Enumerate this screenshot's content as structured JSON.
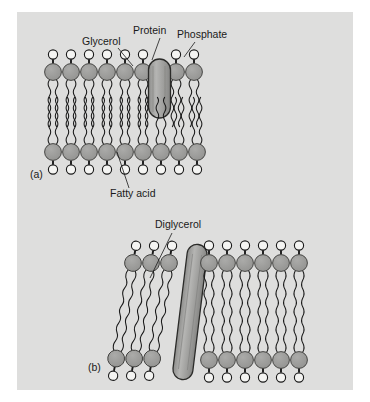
{
  "figure": {
    "title_alt": "Structure of bacterial and archaeal membranes",
    "background_color": "#dededd",
    "page_color": "#ffffff",
    "head_color": "#9b9b9b",
    "phosphate_color": "#f2f2f0",
    "protein_color": "#a8a8a6",
    "outline_color": "#1a1a1a"
  },
  "panels": [
    {
      "id": "a",
      "letter": "(a)",
      "letter_x": 30,
      "letter_y": 178,
      "type": "bilayer",
      "labels": [
        {
          "name": "glycerol",
          "text": "Glycerol",
          "x": 82,
          "y": 45,
          "anchor": "start",
          "leader": {
            "x1": 118,
            "y1": 48,
            "x2": 133,
            "y2": 66
          }
        },
        {
          "name": "protein",
          "text": "Protein",
          "x": 133,
          "y": 34,
          "anchor": "start",
          "leader": {
            "x1": 160,
            "y1": 38,
            "x2": 152,
            "y2": 60
          }
        },
        {
          "name": "phosphate",
          "text": "Phosphate",
          "x": 177,
          "y": 38,
          "anchor": "start",
          "leader": {
            "x1": 195,
            "y1": 42,
            "x2": 184,
            "y2": 60
          }
        },
        {
          "name": "fatty-acid",
          "text": "Fatty acid",
          "x": 110,
          "y": 196,
          "anchor": "start",
          "leader": {
            "x1": 129,
            "y1": 188,
            "x2": 117,
            "y2": 156
          }
        }
      ],
      "upper_leaflet_lipids": 8,
      "lower_leaflet_lipids": 9,
      "protein": {
        "shape": "capsule",
        "cx": 159,
        "cy": 88,
        "rx": 11,
        "ry": 30
      }
    },
    {
      "id": "b",
      "letter": "(b)",
      "letter_x": 88,
      "letter_y": 370,
      "type": "monolayer",
      "labels": [
        {
          "name": "diglycerol",
          "text": "Diglycerol",
          "x": 155,
          "y": 228,
          "anchor": "start",
          "leader": {
            "x1": 172,
            "y1": 233,
            "x2": 184,
            "y2": 249
          }
        }
      ],
      "left_tilted_lipids": 3,
      "right_upright_lipids": 6,
      "protein": {
        "shape": "long-capsule",
        "cx": 182,
        "cy": 310,
        "rx": 9,
        "ry": 62,
        "rotate": 9
      }
    }
  ]
}
